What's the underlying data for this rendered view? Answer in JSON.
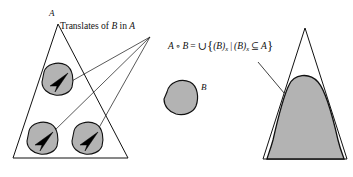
{
  "figure": {
    "labels": {
      "set_a_left": "A",
      "translates_caption": "Translates of B in A",
      "set_b_middle": "B",
      "formula": {
        "lhs_a": "A",
        "operator": "∘",
        "lhs_b": "B",
        "equals": "=",
        "union": "∪",
        "brace_open": "{",
        "term1_b": "(B)",
        "term1_sub": "x",
        "separator": "|",
        "term2_b": "(B)",
        "term2_sub": "x",
        "subset": "⊆",
        "term2_a": "A",
        "brace_close": "}",
        "full_text": "A ∘ B = ∪{(B)x | (B)x ⊆ A}"
      }
    },
    "colors": {
      "stroke": "#111111",
      "fill_gray": "#b3b3b3",
      "background": "#ffffff",
      "arrow_black": "#000000"
    },
    "shapes": {
      "left_triangle": {
        "name": "set-A-left",
        "apex": [
          58,
          24
        ],
        "base_left": [
          13,
          158
        ],
        "base_right": [
          128,
          158
        ]
      },
      "right_triangle": {
        "name": "set-A-right",
        "apex": [
          305,
          28
        ],
        "base_left": [
          263,
          159
        ],
        "base_right": [
          347,
          159
        ]
      },
      "translate_blobs": [
        {
          "name": "translate-blob-top",
          "cx": 55,
          "cy": 79
        },
        {
          "name": "translate-blob-bottom-left",
          "cx": 40,
          "cy": 138
        },
        {
          "name": "translate-blob-bottom-right",
          "cx": 85,
          "cy": 138
        }
      ],
      "structuring_element": {
        "name": "set-B",
        "cx": 182,
        "cy": 97
      },
      "opening_region": {
        "name": "opening-result-region"
      }
    },
    "pointers": {
      "caption_convergence_point": [
        150,
        37
      ],
      "formula_arrow_from": [
        258,
        62
      ],
      "formula_arrow_to": [
        300,
        114
      ]
    }
  }
}
